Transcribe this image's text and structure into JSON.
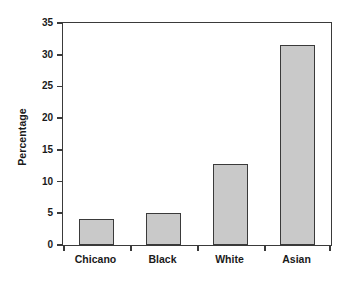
{
  "chart_data": {
    "type": "bar",
    "title": "",
    "xlabel": "",
    "ylabel": "Percentage",
    "categories": [
      "Chicano",
      "Black",
      "White",
      "Asian"
    ],
    "values": [
      4.1,
      5.0,
      12.8,
      31.5
    ],
    "ylim": [
      0,
      35
    ],
    "yticks": [
      0,
      5,
      10,
      15,
      20,
      25,
      30,
      35
    ],
    "ytick_labels": [
      "0",
      "5",
      "10",
      "15",
      "20",
      "25",
      "30",
      "35"
    ],
    "grid": false,
    "legend": null,
    "bar_fill_color": "#c9c9c9",
    "bar_border_color": "#3a3a3a",
    "axis_color": "#3a3a3a",
    "background_color": "#ffffff"
  },
  "axis": {
    "y_title": "Percentage"
  }
}
